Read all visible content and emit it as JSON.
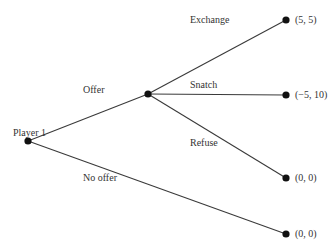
{
  "diagram": {
    "type": "game-tree",
    "root_label": "Player 1",
    "moves": {
      "offer": "Offer",
      "no_offer": "No offer",
      "exchange": "Exchange",
      "snatch": "Snatch",
      "refuse": "Refuse"
    },
    "payoffs": {
      "exchange": "(5, 5)",
      "snatch": "(−5, 10)",
      "refuse": "(0, 0)",
      "no_offer": "(0, 0)"
    },
    "colors": {
      "line": "#3a3a3a",
      "node": "#111111",
      "text": "#333333"
    }
  }
}
